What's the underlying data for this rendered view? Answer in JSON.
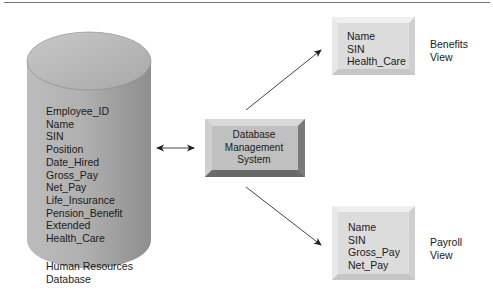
{
  "diagram": {
    "database": {
      "fields": [
        "Employee_ID",
        "Name",
        "SIN",
        "Position",
        "Date_Hired",
        "Gross_Pay",
        "Net_Pay",
        "Life_Insurance",
        "Pension_Benefit",
        "Extended",
        "Health_Care"
      ],
      "caption_line1": "Human Resources",
      "caption_line2": "Database"
    },
    "dbms": {
      "line1": "Database",
      "line2": "Management",
      "line3": "System"
    },
    "benefits_view": {
      "fields": [
        "Name",
        "SIN",
        "Health_Care"
      ],
      "caption_line1": "Benefits",
      "caption_line2": "View"
    },
    "payroll_view": {
      "fields": [
        "Name",
        "SIN",
        "Gross_Pay",
        "Net_Pay"
      ],
      "caption_line1": "Payroll",
      "caption_line2": "View"
    },
    "connections": [
      {
        "from": "Human Resources Database",
        "to": "Database Management System",
        "type": "bidirectional"
      },
      {
        "from": "Database Management System",
        "to": "Benefits View",
        "type": "directed"
      },
      {
        "from": "Database Management System",
        "to": "Payroll View",
        "type": "directed"
      }
    ],
    "colors": {
      "cylinder_fill": "#a8a8a8",
      "box_fill": "#c2c2c2",
      "view_fill": "#e2e2e2",
      "arrow": "#333333"
    }
  }
}
